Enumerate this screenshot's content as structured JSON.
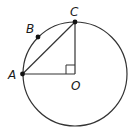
{
  "diagram": {
    "type": "circle-geometry",
    "circle": {
      "center": "O",
      "cx": 75,
      "cy": 74,
      "r": 52
    },
    "points": {
      "A": {
        "label": "A",
        "x": 22.5,
        "y": 74
      },
      "B": {
        "label": "B",
        "x": 38,
        "y": 37
      },
      "C": {
        "label": "C",
        "x": 75,
        "y": 22
      },
      "O": {
        "label": "O",
        "x": 75,
        "y": 74
      }
    },
    "segments": [
      [
        "A",
        "C"
      ],
      [
        "C",
        "O"
      ],
      [
        "A",
        "O"
      ]
    ],
    "right_angle_at": "O",
    "colors": {
      "stroke": "#333333",
      "point": "#111111"
    }
  }
}
